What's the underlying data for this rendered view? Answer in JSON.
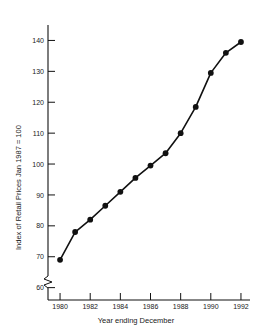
{
  "chart_data": {
    "type": "line",
    "title": "",
    "xlabel": "Year ending December",
    "ylabel": "Index of Retail Prices Jan 1987 = 100",
    "x": [
      1980,
      1981,
      1982,
      1983,
      1984,
      1985,
      1986,
      1987,
      1988,
      1989,
      1990,
      1991,
      1992
    ],
    "values": [
      69.0,
      78.0,
      82.0,
      86.5,
      91.0,
      95.5,
      99.5,
      103.5,
      110.0,
      118.5,
      129.5,
      136.0,
      139.5
    ],
    "categories": [
      "1980",
      "1981",
      "1982",
      "1983",
      "1984",
      "1985",
      "1986",
      "1987",
      "1988",
      "1989",
      "1990",
      "1991",
      "1992"
    ],
    "xlim": [
      1979.2,
      1992.6
    ],
    "ylim": [
      56,
      145
    ],
    "xticks": [
      1980,
      1982,
      1984,
      1986,
      1988,
      1990,
      1992
    ],
    "xtick_labels": [
      "1980",
      "1982",
      "1984",
      "1986",
      "1988",
      "1990",
      "1992"
    ],
    "yticks": [
      60,
      70,
      80,
      90,
      100,
      110,
      120,
      130,
      140
    ],
    "ytick_labels": [
      "60",
      "70",
      "80",
      "90",
      "100",
      "110",
      "120",
      "130",
      "140"
    ],
    "grid": false,
    "legend": false,
    "axis_break": {
      "axis": "y",
      "below": 60,
      "style": "zigzag"
    },
    "marker": "filled-circle",
    "line_color": "#111111",
    "marker_color": "#111111"
  }
}
